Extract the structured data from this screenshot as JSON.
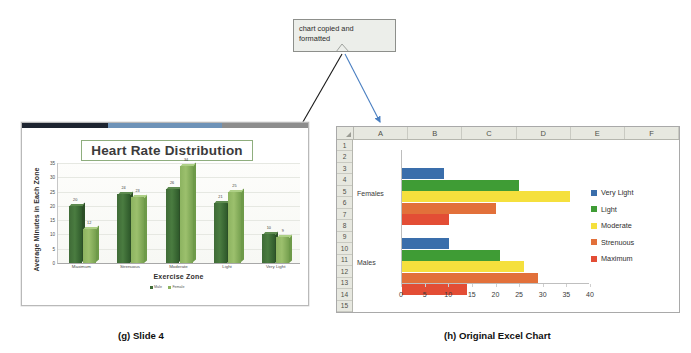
{
  "callout": {
    "line1": "chart copied and",
    "line2": "formatted"
  },
  "arrows": {
    "to_slide": "black-arrow",
    "to_excel": "blue-arrow",
    "blue_color": "#4a7fc1",
    "black_color": "#1a1a1a"
  },
  "slide": {
    "title": "Heart Rate Distribution",
    "topbar": {
      "navy": "#1d2430",
      "blue": "#6e93b8",
      "gray": "#8d8d8d"
    },
    "legend": [
      {
        "label": "Male",
        "color": "#3f6b37"
      },
      {
        "label": "Female",
        "color": "#8cb360"
      }
    ]
  },
  "excel": {
    "columns": [
      "A",
      "B",
      "C",
      "D",
      "E",
      "F"
    ],
    "rows": [
      "1",
      "2",
      "3",
      "4",
      "5",
      "6",
      "7",
      "8",
      "9",
      "10",
      "11",
      "12",
      "13",
      "14",
      "15"
    ]
  },
  "captions": {
    "g": "(g) Slide 4",
    "h": "(h) Original Excel Chart"
  },
  "chart_data": [
    {
      "type": "bar",
      "title": "Heart Rate Distribution",
      "xlabel": "Exercise Zone",
      "ylabel": "Average Minutes in Each Zone",
      "categories": [
        "Maximum",
        "Strenuous",
        "Moderate",
        "Light",
        "Very Light"
      ],
      "ylim": [
        0,
        35
      ],
      "yticks": [
        0,
        5,
        10,
        15,
        20,
        25,
        30,
        35
      ],
      "grid": true,
      "legend_position": "bottom",
      "series": [
        {
          "name": "Male",
          "color": "#3f6b37",
          "values": [
            20,
            24,
            26,
            21,
            10
          ]
        },
        {
          "name": "Female",
          "color": "#8cb360",
          "values": [
            12,
            23,
            34,
            25,
            9
          ]
        }
      ]
    },
    {
      "type": "bar",
      "orientation": "horizontal",
      "title": "",
      "xlabel": "",
      "ylabel": "",
      "categories": [
        "Females",
        "Males"
      ],
      "xlim": [
        0,
        40
      ],
      "xticks": [
        0,
        5,
        10,
        15,
        20,
        25,
        30,
        35,
        40
      ],
      "grid": false,
      "legend_position": "right",
      "series": [
        {
          "name": "Very Light",
          "color": "#3a6eab",
          "values": [
            9,
            10
          ]
        },
        {
          "name": "Light",
          "color": "#3f9c35",
          "values": [
            25,
            21
          ]
        },
        {
          "name": "Moderate",
          "color": "#f5e03d",
          "values": [
            36,
            26
          ]
        },
        {
          "name": "Strenuous",
          "color": "#e2703a",
          "values": [
            20,
            29
          ]
        },
        {
          "name": "Maximum",
          "color": "#e34d35",
          "values": [
            10,
            14
          ]
        }
      ]
    }
  ]
}
